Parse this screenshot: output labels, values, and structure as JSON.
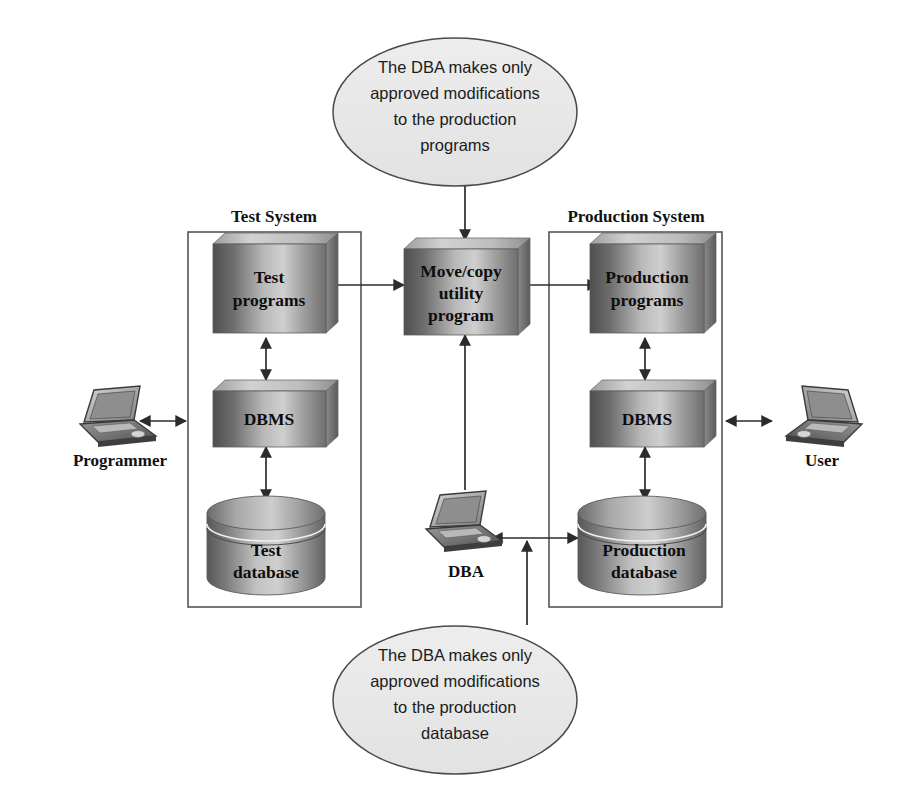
{
  "diagram": {
    "systems": [
      {
        "id": "test-system",
        "label": "Test System"
      },
      {
        "id": "production-system",
        "label": "Production System"
      }
    ],
    "process_boxes": [
      {
        "id": "test-programs",
        "lines": [
          "Test",
          "programs"
        ]
      },
      {
        "id": "test-dbms",
        "lines": [
          "DBMS"
        ]
      },
      {
        "id": "move-copy-utility",
        "lines": [
          "Move/copy",
          "utility",
          "program"
        ]
      },
      {
        "id": "production-programs",
        "lines": [
          "Production",
          "programs"
        ]
      },
      {
        "id": "production-dbms",
        "lines": [
          "DBMS"
        ]
      }
    ],
    "databases": [
      {
        "id": "test-database",
        "lines": [
          "Test",
          "database"
        ]
      },
      {
        "id": "production-database",
        "lines": [
          "Production",
          "database"
        ]
      }
    ],
    "actors": [
      {
        "id": "programmer",
        "label": "Programmer"
      },
      {
        "id": "dba",
        "label": "DBA"
      },
      {
        "id": "user",
        "label": "User"
      }
    ],
    "notes": [
      {
        "id": "note-programs",
        "lines": [
          "The DBA makes only",
          "approved modifications",
          "to the production",
          "programs"
        ]
      },
      {
        "id": "note-database",
        "lines": [
          "The DBA makes only",
          "approved modifications",
          "to the production",
          "database"
        ]
      }
    ],
    "colors": {
      "box_dark": "#5e5e5e",
      "box_light": "#d8d8d8",
      "note_fill": "#e8e8e8",
      "frame_stroke": "#555555",
      "connector": "#2b2b2b",
      "text": "#111111",
      "background": "#ffffff"
    }
  }
}
